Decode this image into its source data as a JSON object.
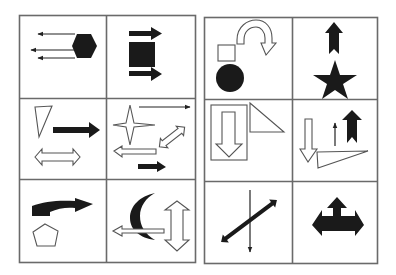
{
  "figure": {
    "panels": [
      {
        "name": "left-grid",
        "cells": [
          {
            "row": 1,
            "col": 1,
            "content": "black hexagon with three thin leftward arrows"
          },
          {
            "row": 1,
            "col": 2,
            "content": "black square with thick right arrows above and below"
          },
          {
            "row": 2,
            "col": 1,
            "content": "outline triangle, thick black right arrow, outline double-headed horizontal arrow"
          },
          {
            "row": 2,
            "col": 2,
            "content": "outline four-point star, thin right arrow, outline diagonal double arrow, outline left arrow, black right arrow"
          },
          {
            "row": 3,
            "col": 1,
            "content": "black curved arrow pointing right, outline pentagon"
          },
          {
            "row": 3,
            "col": 2,
            "content": "black crescent moon, outline left arrow, outline vertical double arrow"
          }
        ]
      },
      {
        "name": "right-grid",
        "cells": [
          {
            "row": 1,
            "col": 1,
            "content": "outline square, black circle, outline U-turn arrow"
          },
          {
            "row": 1,
            "col": 2,
            "content": "black up arrow above black five-point star"
          },
          {
            "row": 2,
            "col": 1,
            "content": "outline rectangle containing outline down arrow, outline right triangle"
          },
          {
            "row": 2,
            "col": 2,
            "content": "outline down arrow, thin up arrow, black up arrow, outline obtuse triangle"
          },
          {
            "row": 3,
            "col": 1,
            "content": "black diagonal double arrow crossed by thin vertical down arrow"
          },
          {
            "row": 3,
            "col": 2,
            "content": "black three-way arrow (up, left, right)"
          }
        ]
      }
    ]
  }
}
